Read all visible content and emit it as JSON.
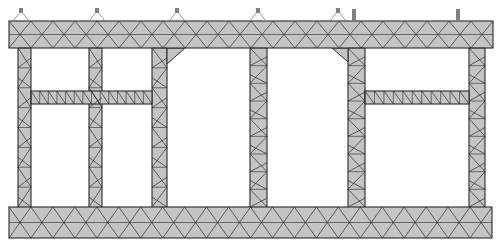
{
  "diagram": {
    "type": "finite-element-mesh",
    "colors": {
      "background": "#ffffff",
      "fill": "#c4c4c4",
      "mesh_line": "#2a2a2a",
      "support": "#808080"
    },
    "top_slab": {
      "x": 9,
      "y": 21,
      "w": 484,
      "h": 27,
      "divisions": 22
    },
    "bottom_slab": {
      "x": 9,
      "y": 207,
      "w": 483,
      "h": 31,
      "divisions": 22
    },
    "columns": [
      {
        "id": "col-1",
        "x": 18,
        "w": 13,
        "divisions": 8
      },
      {
        "id": "col-2",
        "x": 89,
        "w": 13,
        "divisions": 8
      },
      {
        "id": "col-3",
        "x": 152,
        "w": 15,
        "divisions": 8,
        "haunch": "right"
      },
      {
        "id": "col-4",
        "x": 250,
        "w": 17,
        "divisions": 9
      },
      {
        "id": "col-5",
        "x": 348,
        "w": 17,
        "divisions": 9,
        "haunch": "left"
      },
      {
        "id": "col-6",
        "x": 469,
        "w": 16,
        "divisions": 9
      }
    ],
    "mid_beams": [
      {
        "id": "beam-left",
        "x1": 31,
        "x2": 152,
        "y": 91,
        "h": 13,
        "divisions": 14
      },
      {
        "id": "beam-right",
        "x1": 365,
        "x2": 469,
        "y": 91,
        "h": 13,
        "divisions": 11
      }
    ],
    "supports": [
      {
        "id": "support-1",
        "x": 21,
        "kind": "pin"
      },
      {
        "id": "support-2",
        "x": 97,
        "kind": "pin"
      },
      {
        "id": "support-3",
        "x": 177,
        "kind": "pin"
      },
      {
        "id": "support-4",
        "x": 258,
        "kind": "pin"
      },
      {
        "id": "support-5",
        "x": 338,
        "kind": "pin"
      },
      {
        "id": "support-6",
        "x": 354,
        "kind": "post"
      },
      {
        "id": "support-7",
        "x": 458,
        "kind": "post"
      }
    ]
  }
}
